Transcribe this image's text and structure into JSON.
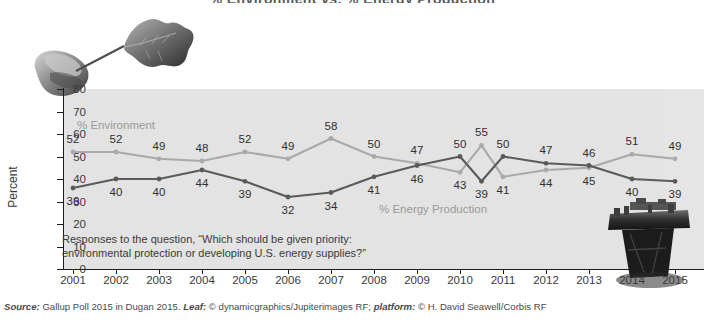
{
  "figure": {
    "title": "% Environment vs. % Energy Production",
    "title_clipped": true,
    "source": {
      "prefix": "Source:",
      "text": " Gallup Poll 2015 in Dugan 2015. ",
      "leaf_label": "Leaf:",
      "leaf_credit": " © dynamicgraphics/Jupiterimages RF; ",
      "platform_label": "platform:",
      "platform_credit": " © H. David Seawell/Corbis RF"
    },
    "annotation": "Responses to the question, “Which should be given priority: environmental protection or developing U.S. energy supplies?”",
    "images": [
      {
        "name": "hand-holding-leaf-photo",
        "alt": "Hand holding an oak leaf"
      },
      {
        "name": "oil-platform-photo",
        "alt": "Offshore oil drilling platform"
      }
    ]
  },
  "chart_data": {
    "type": "line",
    "title": "% Environment vs. % Energy Production",
    "xlabel": "",
    "ylabel": "Percent",
    "ylim": [
      0,
      80
    ],
    "yticks": [
      0,
      10,
      20,
      30,
      40,
      50,
      60,
      70,
      80
    ],
    "grid": false,
    "legend_position": "inline-labels",
    "categories": [
      "2001",
      "2002",
      "2003",
      "2004",
      "2005",
      "2006",
      "2007",
      "2008",
      "2009",
      "2010",
      "2010.5",
      "2011",
      "2012",
      "2013",
      "2014",
      "2015"
    ],
    "xticks": [
      "2001",
      "2002",
      "2003",
      "2004",
      "2005",
      "2006",
      "2007",
      "2008",
      "2009",
      "2010",
      "2011",
      "2012",
      "2013",
      "2014",
      "2015"
    ],
    "series": [
      {
        "name": "% Environment",
        "color": "#a9a9a9",
        "values": [
          52,
          52,
          49,
          48,
          52,
          49,
          58,
          50,
          47,
          43,
          55,
          41,
          44,
          45,
          51,
          49
        ]
      },
      {
        "name": "% Energy Production",
        "color": "#5a5a5a",
        "values": [
          36,
          40,
          40,
          44,
          39,
          32,
          34,
          41,
          46,
          50,
          39,
          50,
          47,
          46,
          40,
          39
        ]
      }
    ]
  },
  "colors": {
    "panel_background": "#e3e3e3",
    "environment_line": "#a9a9a9",
    "energy_line": "#5a5a5a",
    "axis": "#1d1d1d",
    "text": "#3a3a3a"
  }
}
